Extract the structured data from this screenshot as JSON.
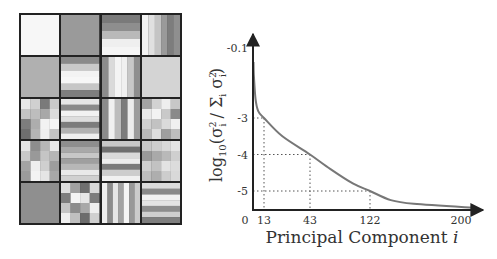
{
  "tiles": {
    "rows": 5,
    "cols": 4,
    "description": "Grid of 20 grayscale principal-component basis images",
    "cells": [
      {
        "type": "flat",
        "shade": "#f7f7f7"
      },
      {
        "type": "flat",
        "shade": "#9a9a9a"
      },
      {
        "type": "hbands",
        "bands": [
          "#7a7a7a",
          "#8e8e8e",
          "#b9b9b9",
          "#efefef",
          "#f5f5f5"
        ]
      },
      {
        "type": "vbands",
        "bands": [
          "#f3f3f3",
          "#e0e0e0",
          "#c4c4c4",
          "#9a9a9a",
          "#7d7d7d",
          "#8f8f8f"
        ]
      },
      {
        "type": "flat",
        "shade": "#b0b0b0"
      },
      {
        "type": "hbands",
        "bands": [
          "#8a8a8a",
          "#c9c9c9",
          "#f3f3f3",
          "#f7f7f7",
          "#c6c6c6",
          "#7e7e7e"
        ]
      },
      {
        "type": "vbands",
        "bands": [
          "#8c8c8c",
          "#dadada",
          "#f4f4f4",
          "#f0f0f0",
          "#c7c7c7",
          "#8e8e8e"
        ]
      },
      {
        "type": "flat",
        "shade": "#d4d4d4"
      },
      {
        "type": "checker",
        "cells": [
          [
            "#e8e8e8",
            "#d0d0d0",
            "#7a7a7a",
            "#c9c9c9"
          ],
          [
            "#c4c4c4",
            "#bdbdbd",
            "#a8a8a8",
            "#dcdcdc"
          ],
          [
            "#7d7d7d",
            "#adadad",
            "#f2f2f2",
            "#f6f6f6"
          ],
          [
            "#6f6f6f",
            "#b4b4b4",
            "#efefef",
            "#c5c5c5"
          ]
        ]
      },
      {
        "type": "hbands",
        "bands": [
          "#e6e6e6",
          "#8a8a8a",
          "#f2f2f2",
          "#dedede",
          "#7c7c7c",
          "#b2b2b2",
          "#efefef"
        ]
      },
      {
        "type": "vbands",
        "bands": [
          "#8b8b8b",
          "#f0f0f0",
          "#bcbcbc",
          "#7c7c7c",
          "#ececec",
          "#9c9c9c"
        ]
      },
      {
        "type": "checker",
        "cells": [
          [
            "#a3a3a3",
            "#d2d2d2",
            "#eeeeee",
            "#c7c7c7"
          ],
          [
            "#e9e9e9",
            "#f3f3f3",
            "#c9c9c9",
            "#8a8a8a"
          ],
          [
            "#d0d0d0",
            "#c2c2c2",
            "#dadada",
            "#f0f0f0"
          ],
          [
            "#b9b9b9",
            "#dddddd",
            "#9f9f9f",
            "#bdbdbd"
          ]
        ]
      },
      {
        "type": "checker",
        "cells": [
          [
            "#e5e5e5",
            "#8d8d8d",
            "#b7b7b7",
            "#e9e9e9"
          ],
          [
            "#c8c8c8",
            "#999999",
            "#c5c5c5",
            "#b5b5b5"
          ],
          [
            "#a4a4a4",
            "#eeeeee",
            "#cfcfcf",
            "#9d9d9d"
          ],
          [
            "#9b9b9b",
            "#f3f3f3",
            "#e5e5e5",
            "#a7a7a7"
          ]
        ]
      },
      {
        "type": "hbands",
        "bands": [
          "#8e8e8e",
          "#a9a9a9",
          "#c7c7c7",
          "#9f9f9f",
          "#b7b7b7",
          "#e9e9e9",
          "#d0d0d0"
        ]
      },
      {
        "type": "hbands",
        "bands": [
          "#c7c7c7",
          "#6f6f6f",
          "#dadada",
          "#ededed",
          "#7b7b7b",
          "#cdcdcd",
          "#f1f1f1"
        ]
      },
      {
        "type": "checker",
        "cells": [
          [
            "#c7c7c7",
            "#cdcdcd",
            "#d8d8d8",
            "#e4e4e4"
          ],
          [
            "#9a9a9a",
            "#a9a9a9",
            "#b9b9b9",
            "#cfcfcf"
          ],
          [
            "#cfcfcf",
            "#c2c2c2",
            "#e3e3e3",
            "#dcdcdc"
          ],
          [
            "#bdbdbd",
            "#aeaeae",
            "#cdcdcd",
            "#d9d9d9"
          ]
        ]
      },
      {
        "type": "flat",
        "shade": "#8f8f8f"
      },
      {
        "type": "checker",
        "cells": [
          [
            "#dedede",
            "#a0a0a0",
            "#6f6f6f",
            "#d8d8d8"
          ],
          [
            "#7d7d7d",
            "#f4f4f4",
            "#e6e6e6",
            "#7c7c7c"
          ],
          [
            "#c5c5c5",
            "#8c8c8c",
            "#a8a8a8",
            "#efefef"
          ],
          [
            "#f0f0f0",
            "#bfbfbf",
            "#6c6c6c",
            "#d0d0d0"
          ]
        ]
      },
      {
        "type": "vbands",
        "bands": [
          "#f0f0f0",
          "#8c8c8c",
          "#e6e6e6",
          "#a3a3a3",
          "#f5f5f5",
          "#989898",
          "#cbcbcb"
        ]
      },
      {
        "type": "hbands",
        "bands": [
          "#dbdbdb",
          "#8a8a8a",
          "#f2f2f2",
          "#e3e3e3",
          "#8d8d8d",
          "#cfcfcf",
          "#7f7f7f"
        ]
      }
    ]
  },
  "chart_data": {
    "type": "line",
    "title": "",
    "xlabel": "Principal Component i",
    "ylabel": "log10(σi² / Σi σi²)",
    "x_ticks": [
      "0",
      "13",
      "43",
      "122",
      "200"
    ],
    "y_ticks": [
      "-0.1",
      "-3",
      "-4",
      "-5"
    ],
    "xlim": [
      0,
      200
    ],
    "ylim": [
      -5.5,
      -0.1
    ],
    "grid": false,
    "legend": null,
    "series": [
      {
        "name": "normalized eigenvalue spectrum",
        "x": [
          1,
          3,
          6,
          13,
          25,
          43,
          70,
          100,
          122,
          140,
          160,
          200
        ],
        "y": [
          -1.2,
          -2.2,
          -2.7,
          -3.0,
          -3.5,
          -4.0,
          -4.4,
          -4.8,
          -5.0,
          -5.25,
          -5.35,
          -5.5
        ]
      }
    ],
    "annotations": [
      {
        "type": "dotted-guide",
        "x": 13,
        "y": -3
      },
      {
        "type": "dotted-guide",
        "x": 43,
        "y": -4
      },
      {
        "type": "dotted-guide",
        "x": 122,
        "y": -5
      }
    ],
    "color": "#777777"
  }
}
